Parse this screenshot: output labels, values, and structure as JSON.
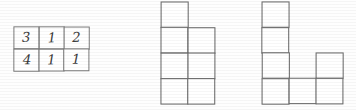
{
  "figure": {
    "background_color": "#fefefe",
    "line_color": "#6b6b6b",
    "digit_color": "#3a3a3a"
  },
  "number_table": {
    "name": "number-grid",
    "rows": 2,
    "columns": 3,
    "origin": {
      "x": 14,
      "y": 27
    },
    "cell_width": 25,
    "cell_height": 22,
    "values": [
      [
        "3",
        "1",
        "2"
      ],
      [
        "4",
        "1",
        "1"
      ]
    ]
  },
  "shape_middle": {
    "name": "polyomino-middle",
    "origin": {
      "x": 161,
      "y": 2
    },
    "cell_width": 27,
    "cell_height": 25.5,
    "grid_rows": 4,
    "grid_columns": 2,
    "cell_count": 7,
    "occupancy": [
      [
        1,
        0
      ],
      [
        1,
        1
      ],
      [
        1,
        1
      ],
      [
        1,
        1
      ]
    ]
  },
  "shape_right": {
    "name": "polyomino-right",
    "origin": {
      "x": 262,
      "y": 2
    },
    "cell_width": 27,
    "cell_height": 25.5,
    "grid_rows": 4,
    "grid_columns": 3,
    "cell_count": 6,
    "occupancy": [
      [
        1,
        0,
        0
      ],
      [
        1,
        0,
        0
      ],
      [
        1,
        0,
        1
      ],
      [
        1,
        1,
        1
      ]
    ]
  }
}
